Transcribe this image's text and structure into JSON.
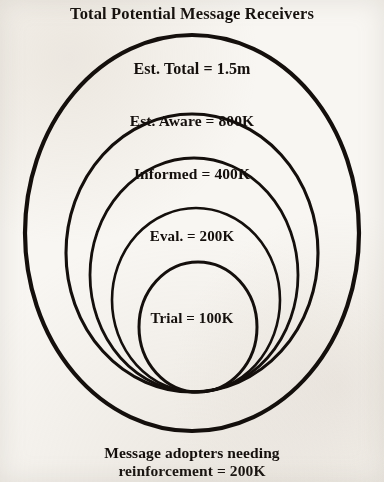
{
  "title": "Total Potential Message Receivers",
  "caption": {
    "line1": "Message adopters needing",
    "line2": "reinforcement = 200K"
  },
  "colors": {
    "background": "#f8f6f2",
    "ink": "#140f0c",
    "stroke": "#140f0c"
  },
  "chart_data": {
    "type": "funnel",
    "title": "Total Potential Message Receivers",
    "subtitle": "",
    "xlabel": "",
    "ylabel": "",
    "annotations": [
      "Message adopters needing reinforcement = 200K"
    ],
    "legend": [],
    "grid": false,
    "categories": [
      "Est. Total",
      "Est. Aware",
      "Informed",
      "Eval.",
      "Trial"
    ],
    "values": [
      1500000,
      800000,
      400000,
      200000,
      100000
    ],
    "value_labels": [
      "1.5m",
      "800K",
      "400K",
      "200K",
      "100K"
    ],
    "rings": [
      {
        "index": 0,
        "label": "Est. Total = 1.5m",
        "stage": "Est. Total",
        "value": 1500000,
        "value_label": "1.5m",
        "cx": 192,
        "cy": 233,
        "rx": 167,
        "ry": 198,
        "stroke_width": 4.2
      },
      {
        "index": 1,
        "label": "Est. Aware = 800K",
        "stage": "Est. Aware",
        "value": 800000,
        "value_label": "800K",
        "cx": 192,
        "cy": 253,
        "rx": 126,
        "ry": 139,
        "stroke_width": 3.1
      },
      {
        "index": 2,
        "label": "Informed = 400K",
        "stage": "Informed",
        "value": 400000,
        "value_label": "400K",
        "cx": 194,
        "cy": 275,
        "rx": 104,
        "ry": 117,
        "stroke_width": 2.8
      },
      {
        "index": 3,
        "label": "Eval. = 200K",
        "stage": "Eval.",
        "value": 200000,
        "value_label": "200K",
        "cx": 196,
        "cy": 300,
        "rx": 84,
        "ry": 92,
        "stroke_width": 2.6
      },
      {
        "index": 4,
        "label": "Trial = 100K",
        "stage": "Trial",
        "value": 100000,
        "value_label": "100K",
        "cx": 198,
        "cy": 327,
        "rx": 59,
        "ry": 65,
        "stroke_width": 3.0
      }
    ]
  }
}
